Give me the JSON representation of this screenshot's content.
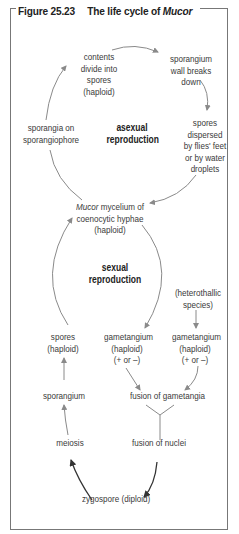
{
  "figure": {
    "number": "Figure 25.23",
    "title_prefix": "The life cycle of",
    "title_organism": "Mucor"
  },
  "cycles": {
    "asexual": {
      "label_line1": "asexual",
      "label_line2": "reproduction"
    },
    "sexual": {
      "label_line1": "sexual",
      "label_line2": "reproduction"
    }
  },
  "nodes": {
    "contents_divide": [
      "contents",
      "divide into",
      "spores",
      "(haploid)"
    ],
    "sporangium_wall": [
      "sporangium",
      "wall breaks",
      "down"
    ],
    "spores_dispersed": [
      "spores",
      "dispersed",
      "by flies' feet",
      "or by water",
      "droplets"
    ],
    "sporangia_on": [
      "sporangia on",
      "sporangiophore"
    ],
    "mycelium": {
      "italic": "Mucor",
      "line1_rest": " mycelium of",
      "line2": "coenocytic hyphae",
      "line3": "(haploid)"
    },
    "heterothallic": [
      "(heterothallic",
      "species)"
    ],
    "spores_haploid": [
      "spores",
      "(haploid)"
    ],
    "gametangium_left": [
      "gametangium",
      "(haploid)",
      "(+ or –)"
    ],
    "gametangium_right": [
      "gametangium",
      "(haploid)",
      "(+ or –)"
    ],
    "sporangium": "sporangium",
    "fusion_gametangia": "fusion of gametangia",
    "meiosis": "meiosis",
    "fusion_nuclei": "fusion of nuclei",
    "zygospore": "zygospore (diploid)"
  },
  "colors": {
    "text": "#3a3a3a",
    "arrow_light": "#8a8a8a",
    "arrow_dark": "#333333",
    "frame": "#777777"
  }
}
